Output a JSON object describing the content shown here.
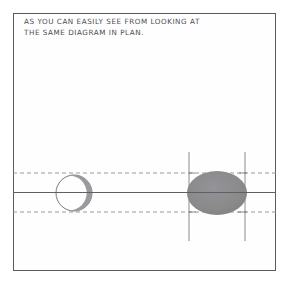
{
  "image": {
    "kind": "scanned-hand-drawn-diagram",
    "width": 293,
    "height": 286,
    "background_color": "#ffffff"
  },
  "panel": {
    "name": "diagram-panel",
    "border_color": "#5a5a5f",
    "left": 13,
    "top": 13,
    "width": 263,
    "height": 258
  },
  "caption": {
    "line1": "AS YOU CAN EASILY SEE FROM LOOKING AT",
    "line2": "THE SAME DIAGRAM IN PLAN.",
    "text_color": "#4c4c52"
  },
  "diagram": {
    "line_color": "#6b6b70",
    "dashed_color": "#8e8e93",
    "fill_gray": "#8a8a8a",
    "crescent_gray": "#9a9a9f",
    "center_line": {
      "label": "horizontal-center-axis",
      "y": 192,
      "x_start": 13,
      "x_end": 276
    },
    "dashed_lines": [
      {
        "label": "upper-dashed-guide",
        "y": 173,
        "x_start": 13,
        "x_end": 276
      },
      {
        "label": "lower-dashed-guide",
        "y": 212,
        "x_start": 13,
        "x_end": 276
      }
    ],
    "vertical_lines": [
      {
        "label": "left-vertical-guide",
        "x": 189,
        "y_start": 152,
        "y_end": 241
      },
      {
        "label": "right-vertical-guide",
        "x": 245,
        "y_start": 152,
        "y_end": 241
      }
    ],
    "circle": {
      "label": "outlined-circle-with-crescent",
      "cx": 74,
      "cy": 193,
      "r": 18,
      "fill": "none",
      "stroke": "#7a7a80",
      "crescent_side": "right"
    },
    "ellipse": {
      "label": "filled-gray-ellipse",
      "cx": 217,
      "cy": 193,
      "rx": 30,
      "ry": 22,
      "fill": "#8a8a8a"
    }
  }
}
